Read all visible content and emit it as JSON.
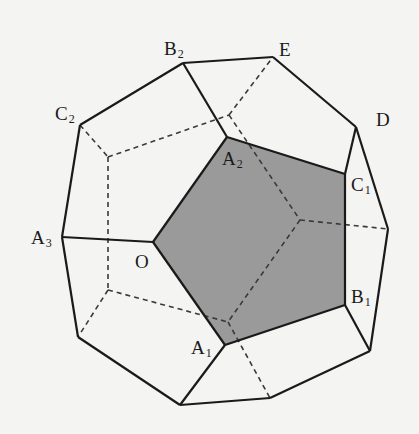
{
  "diagram": {
    "colors": {
      "background": "#f4f4f2",
      "stroke": "#1a1a1a",
      "hidden_stroke": "#3a3a3a",
      "shaded_face": "#9a9a9a"
    },
    "vertices": {
      "B2": {
        "x": 183,
        "y": 63
      },
      "E": {
        "x": 273,
        "y": 57
      },
      "D": {
        "x": 356,
        "y": 127
      },
      "R1": {
        "x": 388,
        "y": 229
      },
      "R2": {
        "x": 370,
        "y": 351
      },
      "R3": {
        "x": 270,
        "y": 398
      },
      "R4": {
        "x": 180,
        "y": 405
      },
      "L1": {
        "x": 78,
        "y": 337
      },
      "A3": {
        "x": 62,
        "y": 237
      },
      "C2": {
        "x": 80,
        "y": 125
      },
      "A2": {
        "x": 227,
        "y": 137
      },
      "C1": {
        "x": 345,
        "y": 174
      },
      "B1": {
        "x": 345,
        "y": 305
      },
      "A1": {
        "x": 225,
        "y": 345
      },
      "O": {
        "x": 153,
        "y": 242
      },
      "H_P1": {
        "x": 108,
        "y": 157
      },
      "H_top": {
        "x": 229,
        "y": 115
      },
      "H_center": {
        "x": 300,
        "y": 220
      },
      "H_P2": {
        "x": 108,
        "y": 290
      },
      "H_bottom": {
        "x": 228,
        "y": 322
      }
    },
    "shaded_face": [
      "A2",
      "C1",
      "B1",
      "A1",
      "O"
    ],
    "solid_edges": [
      [
        "B2",
        "E"
      ],
      [
        "E",
        "D"
      ],
      [
        "D",
        "R1"
      ],
      [
        "R1",
        "R2"
      ],
      [
        "R2",
        "R3"
      ],
      [
        "R3",
        "R4"
      ],
      [
        "R4",
        "L1"
      ],
      [
        "L1",
        "A3"
      ],
      [
        "A3",
        "C2"
      ],
      [
        "C2",
        "B2"
      ],
      [
        "B2",
        "A2"
      ],
      [
        "A2",
        "C1"
      ],
      [
        "C1",
        "B1"
      ],
      [
        "B1",
        "A1"
      ],
      [
        "A1",
        "O"
      ],
      [
        "O",
        "A2"
      ],
      [
        "C1",
        "D"
      ],
      [
        "B1",
        "R2"
      ],
      [
        "A1",
        "R4"
      ],
      [
        "O",
        "A3"
      ]
    ],
    "hidden_edges": [
      [
        "C2",
        "H_P1"
      ],
      [
        "H_P1",
        "H_top"
      ],
      [
        "H_top",
        "E"
      ],
      [
        "H_top",
        "H_center"
      ],
      [
        "H_center",
        "R1"
      ],
      [
        "H_center",
        "H_bottom"
      ],
      [
        "H_P1",
        "H_P2"
      ],
      [
        "H_P2",
        "L1"
      ],
      [
        "H_P2",
        "H_bottom"
      ],
      [
        "H_bottom",
        "R3"
      ]
    ],
    "labels": [
      {
        "id": "B2",
        "main": "B",
        "sub": "2",
        "x": 164,
        "y": 55
      },
      {
        "id": "E",
        "main": "E",
        "sub": "",
        "x": 279,
        "y": 56
      },
      {
        "id": "D",
        "main": "D",
        "sub": "",
        "x": 376,
        "y": 126
      },
      {
        "id": "C2",
        "main": "C",
        "sub": "2",
        "x": 55,
        "y": 120
      },
      {
        "id": "A2",
        "main": "A",
        "sub": "2",
        "x": 222,
        "y": 165
      },
      {
        "id": "C1",
        "main": "C",
        "sub": "1",
        "x": 351,
        "y": 191
      },
      {
        "id": "A3",
        "main": "A",
        "sub": "3",
        "x": 31,
        "y": 244
      },
      {
        "id": "O",
        "main": "O",
        "sub": "",
        "x": 135,
        "y": 268
      },
      {
        "id": "B1",
        "main": "B",
        "sub": "1",
        "x": 351,
        "y": 303
      },
      {
        "id": "A1",
        "main": "A",
        "sub": "1",
        "x": 191,
        "y": 354
      }
    ]
  }
}
